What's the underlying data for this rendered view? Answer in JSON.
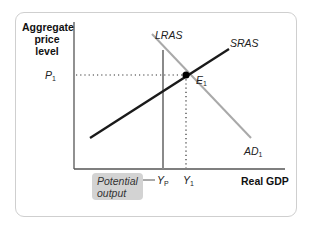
{
  "diagram": {
    "type": "AD-AS model (short-run equilibrium at potential output)",
    "y_axis_label": "Aggregate price level",
    "y_axis_label_lines": [
      "Aggregate",
      "price",
      "level"
    ],
    "x_axis_label": "Real GDP",
    "curves": {
      "lras": {
        "label": "LRAS",
        "color": "#8a8a8a"
      },
      "sras": {
        "label": "SRAS",
        "color": "#1a1a1a"
      },
      "ad": {
        "label": "AD",
        "sub": "1",
        "color": "#a9a9a9"
      }
    },
    "equilibrium": {
      "label": "E",
      "sub": "1"
    },
    "price_tick": {
      "label": "P",
      "sub": "1"
    },
    "x_ticks": [
      {
        "label": "Y",
        "sub": "P"
      },
      {
        "label": "Y",
        "sub": "1"
      }
    ],
    "callout": {
      "text_lines": [
        "Potential",
        "output"
      ],
      "bg_color": "#d3d3d3"
    }
  }
}
